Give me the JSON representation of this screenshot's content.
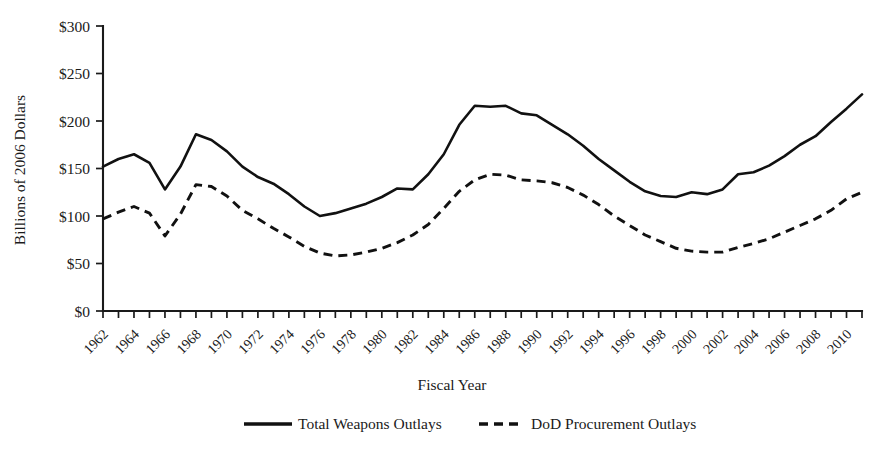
{
  "chart_data": {
    "type": "line",
    "title": "",
    "xlabel": "Fiscal Year",
    "ylabel": "Billions of 2006 Dollars",
    "ylim": [
      0,
      300
    ],
    "ytick_step": 50,
    "ytick_labels": [
      "$0",
      "$50",
      "$100",
      "$150",
      "$200",
      "$250",
      "$300"
    ],
    "ytick_values": [
      0,
      50,
      100,
      150,
      200,
      250,
      300
    ],
    "xlim": [
      1962,
      2011
    ],
    "xtick_labels": [
      "1962",
      "1964",
      "1966",
      "1968",
      "1970",
      "1972",
      "1974",
      "1976",
      "1978",
      "1980",
      "1982",
      "1984",
      "1986",
      "1988",
      "1990",
      "1992",
      "1994",
      "1996",
      "1998",
      "2000",
      "2002",
      "2004",
      "2006",
      "2008",
      "2010"
    ],
    "xtick_values": [
      1962,
      1964,
      1966,
      1968,
      1970,
      1972,
      1974,
      1976,
      1978,
      1980,
      1982,
      1984,
      1986,
      1988,
      1990,
      1992,
      1994,
      1996,
      1998,
      2000,
      2002,
      2004,
      2006,
      2008,
      2010
    ],
    "xtick_rotation": 45,
    "grid": false,
    "legend_position": "below",
    "x": [
      1962,
      1963,
      1964,
      1965,
      1966,
      1967,
      1968,
      1969,
      1970,
      1971,
      1972,
      1973,
      1974,
      1975,
      1976,
      1977,
      1978,
      1979,
      1980,
      1981,
      1982,
      1983,
      1984,
      1985,
      1986,
      1987,
      1988,
      1989,
      1990,
      1991,
      1992,
      1993,
      1994,
      1995,
      1996,
      1997,
      1998,
      1999,
      2000,
      2001,
      2002,
      2003,
      2004,
      2005,
      2006,
      2007,
      2008,
      2009,
      2010,
      2011
    ],
    "series": [
      {
        "name": "Total Weapons Outlays",
        "style": "solid",
        "color": "#111111",
        "values": [
          152,
          160,
          165,
          156,
          128,
          152,
          186,
          180,
          168,
          152,
          141,
          134,
          123,
          110,
          100,
          103,
          108,
          113,
          120,
          129,
          128,
          144,
          165,
          196,
          216,
          215,
          216,
          208,
          206,
          196,
          186,
          174,
          160,
          148,
          136,
          126,
          121,
          120,
          125,
          123,
          128,
          144,
          146,
          153,
          163,
          175,
          184,
          199,
          213,
          228
        ]
      },
      {
        "name": "DoD Procurement Outlays",
        "style": "dashed",
        "color": "#111111",
        "values": [
          97,
          104,
          110,
          103,
          79,
          102,
          133,
          131,
          121,
          106,
          97,
          87,
          78,
          68,
          61,
          58,
          59,
          62,
          66,
          72,
          80,
          91,
          108,
          126,
          138,
          144,
          143,
          138,
          137,
          135,
          130,
          122,
          112,
          100,
          90,
          80,
          73,
          66,
          63,
          62,
          62,
          67,
          71,
          76,
          83,
          90,
          97,
          106,
          118,
          125
        ]
      }
    ],
    "legend": [
      {
        "label": "Total Weapons Outlays",
        "style": "solid"
      },
      {
        "label": "DoD Procurement Outlays",
        "style": "dashed"
      }
    ]
  }
}
